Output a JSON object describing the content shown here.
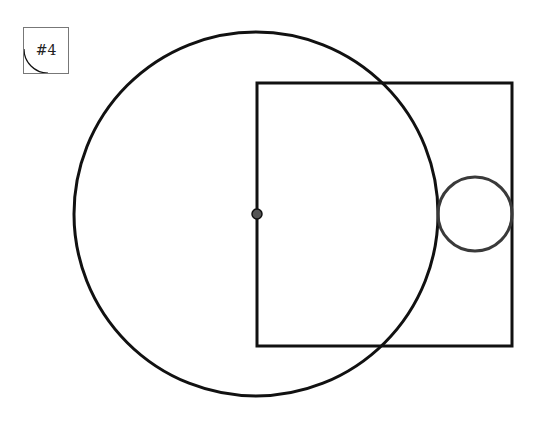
{
  "diagram": {
    "label": "#4",
    "colors": {
      "primary_stroke": "#111111",
      "secondary_stroke": "#3a3a3a",
      "label_border": "#777777",
      "center_dot_fill": "#555555",
      "background": "#ffffff"
    },
    "shapes": {
      "large_circle": {
        "cx": 256,
        "cy": 214,
        "r": 182,
        "stroke_width": 3
      },
      "square": {
        "x": 257,
        "y": 83,
        "width": 255,
        "height": 263,
        "stroke_width": 3
      },
      "small_circle": {
        "cx": 475,
        "cy": 214,
        "r": 37,
        "stroke_width": 3
      },
      "center_point": {
        "cx": 257,
        "cy": 214,
        "r": 5
      }
    }
  }
}
